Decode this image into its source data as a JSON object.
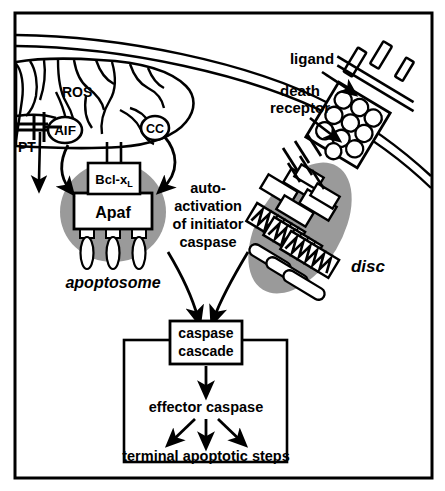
{
  "figure": {
    "background_color": "#ffffff",
    "stroke_color": "#000000",
    "shade_color": "#9a9a9a",
    "frame": {
      "name": "outer-border",
      "border_color": "#000000"
    }
  },
  "labels": {
    "ros": "ROS",
    "aif": "AIF",
    "cc": "CC",
    "pt": "PT",
    "bclx": "Bcl-x",
    "bclx_subscript": "L",
    "apaf": "Apaf",
    "apoptosome": "apoptosome",
    "ligand": "ligand",
    "death_receptor_line1": "death",
    "death_receptor_line2": "receptor",
    "disc": "disc",
    "auto_line1": "auto-",
    "auto_line2": "activation",
    "auto_line3": "of initiator",
    "auto_line4": "caspase",
    "caspase_cascade_line1": "caspase",
    "caspase_cascade_line2": "cascade",
    "effector_caspase": "effector caspase",
    "terminal_steps": "terminal apoptotic steps"
  },
  "structures": {
    "cell_membrane": "double-line arc across upper portion",
    "mitochondrion": "organelle with cristae at upper left",
    "apoptosome_body": "gray ellipse containing Apaf and Bcl-xL boxes with three procaspase appendages",
    "disc_body": "gray elongated ellipse containing receptor tails, adaptor boxes and zigzag death-effector domains",
    "ligand_trimer": "three-rod ligand bound across membrane",
    "receptor_circles_count": 10,
    "procaspase_count": 3,
    "zigzag_count": 3,
    "disc_tail_count": 3
  },
  "arrows": {
    "pt_release": "downward arrow from PT pore",
    "aif_to_apoptosome": "curved arrow from AIF to apoptosome",
    "cc_to_apoptosome": "curved arrow from CC to apoptosome",
    "ligand_pointer": "arrow from ligand label to ligand",
    "receptor_pointer": "arrow from death receptor label to receptor",
    "apoptosome_to_cascade": "curved arrow into caspase cascade",
    "disc_to_cascade": "curved arrow into caspase cascade",
    "cascade_to_effector": "straight down arrow",
    "effector_to_terminal_left": "diagonal down-left arrow",
    "effector_to_terminal_mid": "straight down arrow",
    "effector_to_terminal_right": "diagonal down-right arrow"
  }
}
